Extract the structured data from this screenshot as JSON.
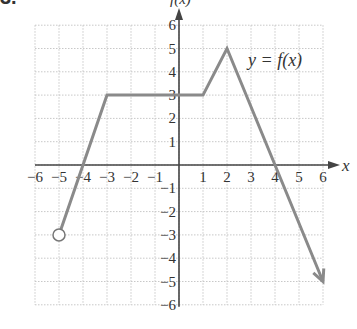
{
  "problem_number": "3.",
  "chart_data": {
    "type": "line",
    "title": "",
    "annotation": "y = f(x)",
    "xlabel": "x",
    "ylabel": "f(x)",
    "xlim": [
      -6,
      6
    ],
    "ylim": [
      -6,
      6
    ],
    "grid": true,
    "x_ticks": [
      "-6",
      "-5",
      "-4",
      "-3",
      "-2",
      "-1",
      "1",
      "2",
      "3",
      "4",
      "5",
      "6"
    ],
    "y_ticks": [
      "6",
      "5",
      "4",
      "3",
      "2",
      "1",
      "-1",
      "-2",
      "-3",
      "-4",
      "-5",
      "-6"
    ],
    "points": [
      {
        "x": -5,
        "y": -3,
        "marker": "open-circle"
      },
      {
        "x": -3,
        "y": 3
      },
      {
        "x": 1,
        "y": 3
      },
      {
        "x": 2,
        "y": 5
      },
      {
        "x": 6,
        "y": -5,
        "marker": "arrow"
      }
    ],
    "series": [
      {
        "name": "y = f(x)",
        "x": [
          -5,
          -3,
          1,
          2,
          6
        ],
        "y": [
          -3,
          3,
          3,
          5,
          -5
        ]
      }
    ],
    "colors": {
      "line": "#8a8a8a",
      "axis": "#444444",
      "grid": "#c8c8c8"
    }
  }
}
